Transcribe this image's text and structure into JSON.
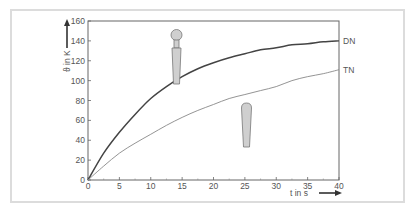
{
  "chart_data": {
    "type": "line",
    "title": "",
    "xlabel": "t  in s",
    "ylabel": "ϑ  in K",
    "xlim": [
      0,
      40
    ],
    "ylim": [
      0,
      160
    ],
    "xticks": [
      0,
      5,
      10,
      15,
      20,
      25,
      30,
      35,
      40
    ],
    "yticks": [
      0,
      20,
      40,
      60,
      80,
      100,
      120,
      140,
      160
    ],
    "grid": false,
    "legend": "inline-right",
    "x": [
      0,
      2.5,
      5,
      7.5,
      10,
      12.5,
      15,
      17.5,
      20,
      22.5,
      25,
      27.5,
      30,
      32.5,
      35,
      37.5,
      40
    ],
    "series": [
      {
        "name": "DN",
        "color": "#444444",
        "values": [
          0,
          27,
          48,
          66,
          82,
          94,
          104,
          112,
          118,
          123,
          127,
          131,
          133,
          136,
          137,
          139,
          140
        ]
      },
      {
        "name": "TN",
        "color": "#888888",
        "values": [
          0,
          14,
          27,
          37,
          46,
          55,
          63,
          70,
          76,
          82,
          86,
          90,
          94,
          100,
          104,
          107,
          111
        ]
      }
    ],
    "annotations": [
      {
        "type": "icon",
        "name": "dn-thermometer-probe",
        "near_series": "DN"
      },
      {
        "type": "icon",
        "name": "tn-thermometer-probe",
        "near_series": "TN"
      }
    ]
  }
}
